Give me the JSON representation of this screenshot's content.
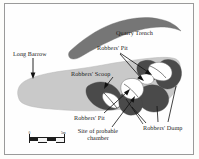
{
  "figure": {
    "kind": "archaeological-site-plan",
    "background_color": "#fdfdfb",
    "frame_color": "#9a9a9a"
  },
  "palette": {
    "barrow_fill": "#c9c9c9",
    "quarry_trench_fill": "#767676",
    "dump_fill": "#4a4a4a",
    "pit_fill": "#ffffff",
    "outline": "#5a5a5a",
    "leader_line": "#111111",
    "text": "#1a1a1a"
  },
  "labels": {
    "quarry_trench": "Quarry Trench",
    "long_barrow": "Long Barrow",
    "robbers_pit_upper": "Robbers' Pit",
    "robbers_scoop": "Robbers' Scoop",
    "robbers_pit_lower": "Robbers' Pit",
    "site_of_probable_chamber": "Site of probable chamber",
    "robbers_dump": "Robbers' Dump"
  },
  "scale_bar": {
    "start_label": "0",
    "end_label": "5m",
    "segments": 4
  },
  "features": [
    {
      "name": "long-barrow",
      "label": "Long Barrow",
      "tone": "light-gray",
      "description": "Large elongated mound running west-east, rounded at the west end and broadening at the east end"
    },
    {
      "name": "quarry-trench",
      "label": "Quarry Trench",
      "tone": "medium-gray",
      "description": "Crescent-shaped arc north of the barrow"
    },
    {
      "name": "robbers-scoop",
      "label": "Robbers' Scoop",
      "tone": "dark-gray",
      "description": "Irregular dark patch in the central-south part of the barrow"
    },
    {
      "name": "robbers-pit-north",
      "label": "Robbers' Pit",
      "tone": "white",
      "description": "White irregular hollow at the north-east of the barrow"
    },
    {
      "name": "robbers-pit-central",
      "label": "Robbers' Pit",
      "tone": "white",
      "description": "White irregular hollow at the centre-east marking the probable chamber"
    },
    {
      "name": "robbers-pit-scoop",
      "label": "Robbers' Pit",
      "tone": "white",
      "description": "White crescent hollow inside the robbers' scoop"
    },
    {
      "name": "robbers-dump-east",
      "label": "Robbers' Dump",
      "tone": "dark-gray",
      "description": "Dark spoil heaps clustered around the eastern pits"
    }
  ]
}
